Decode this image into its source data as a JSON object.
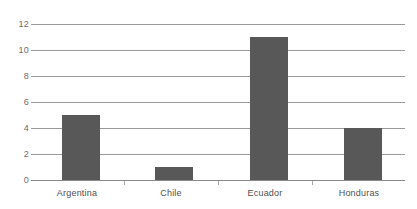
{
  "chart_data": {
    "type": "bar",
    "title": "",
    "subtitle": "",
    "xlabel": "",
    "ylabel": "",
    "categories": [
      "Argentina",
      "Chile",
      "Ecuador",
      "Honduras"
    ],
    "values": [
      5,
      1,
      11,
      4
    ],
    "ylim": [
      0,
      12
    ],
    "ytick_labels": [
      "0",
      "2",
      "4",
      "6",
      "8",
      "10",
      "12"
    ],
    "ytick_values": [
      0,
      2,
      4,
      6,
      8,
      10,
      12
    ],
    "grid": true,
    "grid_axis": "y",
    "legend": false,
    "legend_position": "none",
    "annotations": [],
    "colors": {
      "bar_fill": "#585858",
      "gridline": "#9a9a9a",
      "axis_line": "#8a8a8a",
      "tick_mark": "#a8a8a8",
      "ytick_text": "#6d6d6d",
      "xtick_text": "#4f4f4f",
      "background": "#ffffff"
    }
  }
}
